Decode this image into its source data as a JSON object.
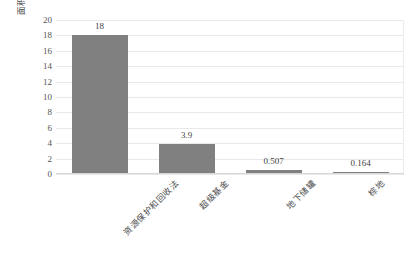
{
  "chart_data": {
    "type": "bar",
    "title": "",
    "xlabel": "",
    "ylabel": "面积（百万英亩）",
    "categories": [
      "资源保护和回收法",
      "超级基金",
      "地下储罐",
      "棕地"
    ],
    "values": [
      18,
      3.9,
      0.507,
      0.164
    ],
    "value_labels": [
      "18",
      "3.9",
      "0.507",
      "0.164"
    ],
    "ylim": [
      0,
      20
    ],
    "ytick_step": 2,
    "yticks": [
      20,
      18,
      16,
      14,
      12,
      10,
      8,
      6,
      4,
      2,
      0
    ],
    "ytick_labels": [
      "20",
      "18",
      "16",
      "14",
      "12",
      "10",
      "8",
      "6",
      "4",
      "2",
      "0"
    ],
    "grid": true,
    "grid_axis": "y",
    "legend": false,
    "legend_position": "none",
    "series": [
      {
        "name": "",
        "values": [
          18,
          3.9,
          0.507,
          0.164
        ]
      }
    ],
    "colors": {
      "bar": "#808080",
      "gridline": "#e8e8e8",
      "baseline": "#d8d8d8",
      "text": "#4a4a4a",
      "background": "#ffffff"
    }
  }
}
